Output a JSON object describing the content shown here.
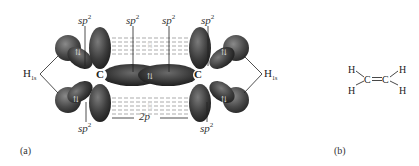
{
  "diagram": {
    "panel_a": {
      "label": "(a)",
      "carbon_left": "C",
      "carbon_right": "C",
      "hybrid_labels": {
        "top": [
          "sp",
          "sp",
          "sp",
          "sp"
        ],
        "bottom": [
          "sp",
          "sp"
        ],
        "superscript": "2"
      },
      "p_orbital_label": "2p",
      "hydrogen_label": "H",
      "hydrogen_subscript": "1s",
      "electron_pair_symbol": "⇅",
      "orbital_color": "#3a3a3a"
    },
    "panel_b": {
      "label": "(b)",
      "atoms": [
        "H",
        "H",
        "C",
        "C",
        "H",
        "H"
      ],
      "bond": "C=C"
    }
  }
}
